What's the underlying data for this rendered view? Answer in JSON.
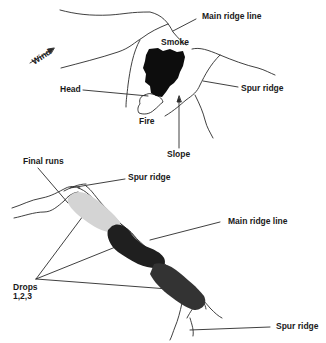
{
  "top_diagram": {
    "labels": {
      "wind": "Wind",
      "main_ridge": "Main ridge line",
      "smoke": "Smoke",
      "spur_ridge": "Spur ridge",
      "head": "Head",
      "fire": "Fire",
      "slope": "Slope"
    }
  },
  "bottom_diagram": {
    "labels": {
      "final_runs": "Final runs",
      "spur_ridge_top": "Spur ridge",
      "main_ridge": "Main ridge line",
      "drops_line1": "Drops",
      "drops_line2": "1,2,3",
      "spur_ridge_bottom": "Spur ridge"
    }
  },
  "colors": {
    "line": "#2a2a2a",
    "smoke": "#0d0d0d",
    "drop_light": "#d4d4d4",
    "drop_dark": "#1f1f1f",
    "drop_mid": "#333333"
  }
}
